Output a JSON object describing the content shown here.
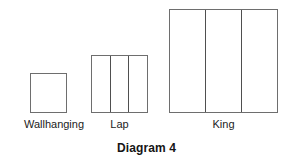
{
  "figure": {
    "caption": "Diagram 4",
    "background_color": "#ffffff",
    "outline_color": "#6e6e6e",
    "divider_color": "#4f4f4f",
    "text_color": "#1c1c1c"
  },
  "shapes": [
    {
      "id": "wallhanging",
      "label": "Wallhanging",
      "panels": 1,
      "width_px": 37,
      "height_px": 40
    },
    {
      "id": "lap",
      "label": "Lap",
      "panels": 3,
      "width_px": 57,
      "height_px": 58
    },
    {
      "id": "king",
      "label": "King",
      "panels": 3,
      "width_px": 109,
      "height_px": 104
    }
  ],
  "chart_data": {
    "type": "bar",
    "title": "Diagram 4",
    "xlabel": "",
    "ylabel": "",
    "categories": [
      "Wallhanging",
      "Lap",
      "King"
    ],
    "values": [
      40,
      58,
      104
    ],
    "widths": [
      37,
      57,
      109
    ],
    "panel_counts": [
      1,
      3,
      3
    ],
    "grid": false,
    "legend": "none",
    "note": "Relative quilt size rectangles drawn to scale, all sharing a common baseline."
  }
}
